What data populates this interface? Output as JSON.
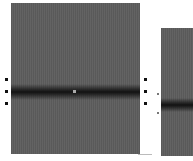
{
  "figure": {
    "panels": [
      {
        "id": "left",
        "description": "grayscale panel with dark horizontal band"
      },
      {
        "id": "right",
        "description": "partial grayscale panel with dark horizontal band"
      }
    ],
    "colors": {
      "panel": "#5e5e5e",
      "band": "#1a1a1a",
      "background": "#ffffff"
    }
  }
}
